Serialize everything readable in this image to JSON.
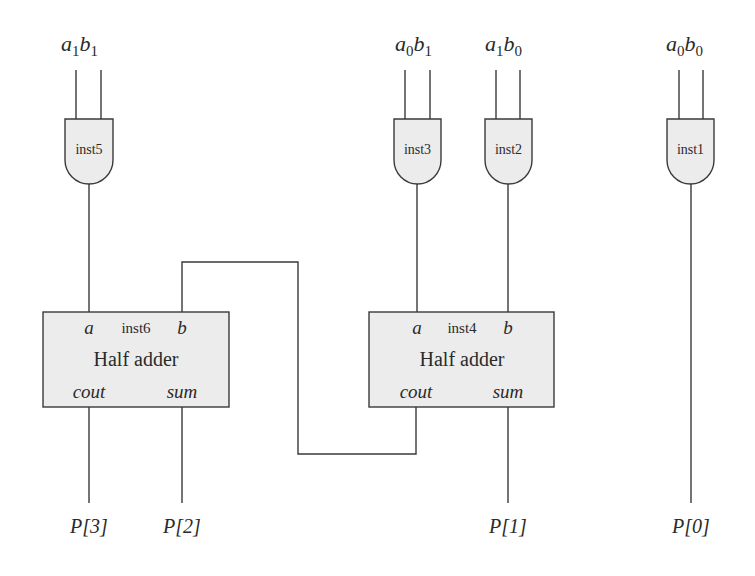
{
  "diagram": {
    "type": "2-bit multiplier circuit",
    "colors": {
      "stroke": "#3a3a3a",
      "fill": "#ececec",
      "text": "#2a2a2a"
    },
    "inputs": [
      {
        "id": "in-a1b1",
        "a": "a",
        "a_sub": "1",
        "b": "b",
        "b_sub": "1"
      },
      {
        "id": "in-a0b1",
        "a": "a",
        "a_sub": "0",
        "b": "b",
        "b_sub": "1"
      },
      {
        "id": "in-a1b0",
        "a": "a",
        "a_sub": "1",
        "b": "b",
        "b_sub": "0"
      },
      {
        "id": "in-a0b0",
        "a": "a",
        "a_sub": "0",
        "b": "b",
        "b_sub": "0"
      }
    ],
    "gates": [
      {
        "id": "inst5",
        "label": "inst5",
        "type": "AND"
      },
      {
        "id": "inst3",
        "label": "inst3",
        "type": "AND"
      },
      {
        "id": "inst2",
        "label": "inst2",
        "type": "AND"
      },
      {
        "id": "inst1",
        "label": "inst1",
        "type": "AND"
      }
    ],
    "half_adders": [
      {
        "id": "inst6",
        "inst": "inst6",
        "title": "Half adder",
        "port_a": "a",
        "port_b": "b",
        "port_cout": "cout",
        "port_sum": "sum"
      },
      {
        "id": "inst4",
        "inst": "inst4",
        "title": "Half adder",
        "port_a": "a",
        "port_b": "b",
        "port_cout": "cout",
        "port_sum": "sum"
      }
    ],
    "outputs": [
      {
        "id": "P3",
        "label": "P[3]"
      },
      {
        "id": "P2",
        "label": "P[2]"
      },
      {
        "id": "P1",
        "label": "P[1]"
      },
      {
        "id": "P0",
        "label": "P[0]"
      }
    ]
  }
}
